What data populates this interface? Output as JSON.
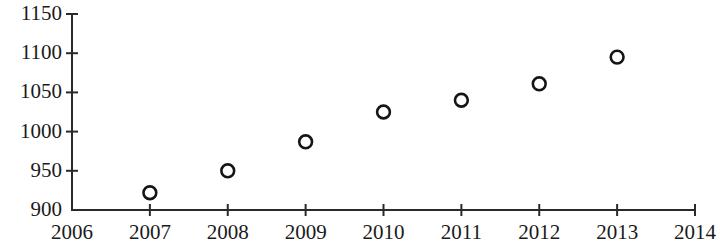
{
  "chart_data": {
    "type": "scatter",
    "title": "",
    "subtitle": "",
    "xlabel": "",
    "ylabel": "",
    "x": [
      2007,
      2008,
      2009,
      2010,
      2011,
      2012,
      2013
    ],
    "values": [
      922,
      950,
      987,
      1025,
      1040,
      1061,
      1095
    ],
    "series": [
      {
        "name": "series-1",
        "marker": "open-circle",
        "color": "#151515",
        "points": [
          {
            "x": 2007,
            "y": 922
          },
          {
            "x": 2008,
            "y": 950
          },
          {
            "x": 2009,
            "y": 987
          },
          {
            "x": 2010,
            "y": 1025
          },
          {
            "x": 2011,
            "y": 1040
          },
          {
            "x": 2012,
            "y": 1061
          },
          {
            "x": 2013,
            "y": 1095
          }
        ]
      }
    ],
    "xlim": [
      2006,
      2014
    ],
    "ylim": [
      900,
      1150
    ],
    "x_ticks": [
      2006,
      2007,
      2008,
      2009,
      2010,
      2011,
      2012,
      2013,
      2014
    ],
    "y_ticks": [
      900,
      950,
      1000,
      1050,
      1100,
      1150
    ],
    "x_tick_labels": [
      "2006",
      "2007",
      "2008",
      "2009",
      "2010",
      "2011",
      "2012",
      "2013",
      "2014"
    ],
    "y_tick_labels": [
      "900",
      "950",
      "1000",
      "1050",
      "1100",
      "1150"
    ],
    "grid": false,
    "legend": null,
    "legend_position": "none",
    "annotations": []
  },
  "style": {
    "background": "#ffffff",
    "axis_color": "#2a2a2a",
    "marker_color": "#151515",
    "text_color": "#1a1a1a"
  }
}
